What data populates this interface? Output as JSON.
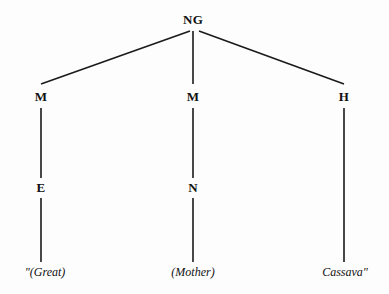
{
  "figure": {
    "type": "tree-diagram",
    "width": 389,
    "height": 294,
    "background_color": "#fdfdfd",
    "line_color": "#1a1a1a",
    "text_color": "#111111"
  },
  "nodes": [
    {
      "id": "root",
      "label": "NG",
      "x": 193,
      "y": 20,
      "style": "bold"
    },
    {
      "id": "left1",
      "label": "M",
      "x": 41,
      "y": 97,
      "style": "bold"
    },
    {
      "id": "mid1",
      "label": "M",
      "x": 193,
      "y": 97,
      "style": "bold"
    },
    {
      "id": "right1",
      "label": "H",
      "x": 344,
      "y": 97,
      "style": "bold"
    },
    {
      "id": "left2",
      "label": "E",
      "x": 41,
      "y": 188,
      "style": "bold"
    },
    {
      "id": "mid2",
      "label": "N",
      "x": 193,
      "y": 188,
      "style": "bold"
    }
  ],
  "glosses": [
    {
      "id": "gloss-left",
      "label": "\"(Great)",
      "x": 45,
      "y": 272
    },
    {
      "id": "gloss-mid",
      "label": "(Mother)",
      "x": 193,
      "y": 272
    },
    {
      "id": "gloss-right",
      "label": "Cassava\"",
      "x": 345,
      "y": 272
    }
  ],
  "edges": [
    {
      "id": "edge-root-left",
      "x1": 190,
      "y1": 31,
      "x2": 41,
      "y2": 84
    },
    {
      "id": "edge-root-mid",
      "x1": 193,
      "y1": 31,
      "x2": 193,
      "y2": 84
    },
    {
      "id": "edge-root-right",
      "x1": 199,
      "y1": 31,
      "x2": 344,
      "y2": 84
    },
    {
      "id": "edge-left1-left2",
      "x1": 41,
      "y1": 108,
      "x2": 41,
      "y2": 178
    },
    {
      "id": "edge-mid1-mid2",
      "x1": 193,
      "y1": 108,
      "x2": 193,
      "y2": 178
    },
    {
      "id": "edge-right1-leaf",
      "x1": 344,
      "y1": 108,
      "x2": 344,
      "y2": 262
    },
    {
      "id": "edge-left2-leaf",
      "x1": 41,
      "y1": 198,
      "x2": 41,
      "y2": 262
    },
    {
      "id": "edge-mid2-leaf",
      "x1": 193,
      "y1": 198,
      "x2": 193,
      "y2": 262
    }
  ]
}
